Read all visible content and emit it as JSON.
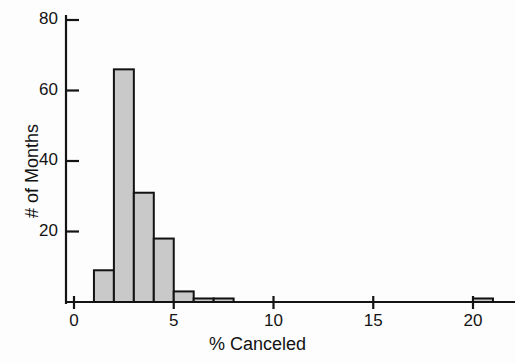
{
  "chart_data": {
    "type": "bar",
    "title": "",
    "subtitle": "",
    "xlabel": "% Canceled",
    "ylabel": "# of Months",
    "xlim": [
      0,
      21.5
    ],
    "ylim": [
      0,
      82
    ],
    "xticks": [
      0,
      5,
      10,
      15,
      20
    ],
    "xtick_labels": [
      "0",
      "5",
      "10",
      "15",
      "20"
    ],
    "yticks": [
      20,
      40,
      60,
      80
    ],
    "ytick_labels": [
      "20",
      "40",
      "60",
      "80"
    ],
    "grid": false,
    "legend": null,
    "bin_width": 1,
    "bars": [
      {
        "bin_start": 1,
        "bin_end": 2,
        "value": 9
      },
      {
        "bin_start": 2,
        "bin_end": 3,
        "value": 66
      },
      {
        "bin_start": 3,
        "bin_end": 4,
        "value": 31
      },
      {
        "bin_start": 4,
        "bin_end": 5,
        "value": 18
      },
      {
        "bin_start": 5,
        "bin_end": 6,
        "value": 3
      },
      {
        "bin_start": 6,
        "bin_end": 7,
        "value": 1
      },
      {
        "bin_start": 7,
        "bin_end": 8,
        "value": 1
      },
      {
        "bin_start": 20,
        "bin_end": 21,
        "value": 1
      }
    ],
    "categories": [
      "1-2",
      "2-3",
      "3-4",
      "4-5",
      "5-6",
      "6-7",
      "7-8",
      "20-21"
    ],
    "values": [
      9,
      66,
      31,
      18,
      3,
      1,
      1,
      1
    ],
    "colors": {
      "bar_fill": "#c9c9c9",
      "bar_stroke": "#121212",
      "axis": "#141414",
      "text": "#121212",
      "background": "#fdfdfd"
    }
  },
  "axis_labels": {
    "x": "% Canceled",
    "y": "# of Months"
  }
}
